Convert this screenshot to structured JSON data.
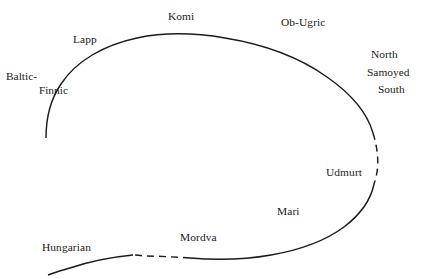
{
  "diagram": {
    "type": "language-continuum-curve",
    "background_color": "#ffffff",
    "stroke_color": "#1b1b1b",
    "labels": {
      "baltic_finnic_line1": "Baltic-",
      "baltic_finnic_line2": "Finnic",
      "lapp": "Lapp",
      "komi": "Komi",
      "ob_ugric": "Ob-Ugric",
      "north": "North",
      "samoyed": "Samoyed",
      "south": "South",
      "udmurt": "Udmurt",
      "mari": "Mari",
      "mordva": "Mordva",
      "hungarian": "Hungarian"
    }
  }
}
